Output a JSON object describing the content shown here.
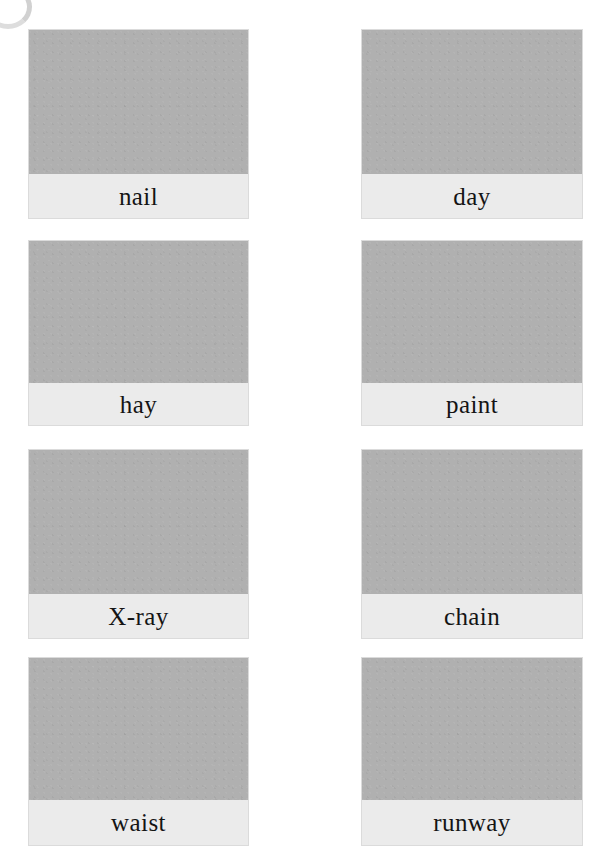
{
  "page": {
    "background_color": "#ffffff",
    "artifact": "scan-edge-arc"
  },
  "styles": {
    "image_placeholder_color": "#b0b0b0",
    "label_band_color": "#e8e8e8",
    "label_text_color": "#141414",
    "card_border_color": "#bebebe"
  },
  "grid": {
    "columns": 2,
    "rows": 4,
    "total_cards": 8
  },
  "cards": [
    {
      "label": "nail",
      "column": "left",
      "row": 1
    },
    {
      "label": "day",
      "column": "right",
      "row": 1
    },
    {
      "label": "hay",
      "column": "left",
      "row": 2
    },
    {
      "label": "paint",
      "column": "right",
      "row": 2
    },
    {
      "label": "X-ray",
      "column": "left",
      "row": 3
    },
    {
      "label": "chain",
      "column": "right",
      "row": 3
    },
    {
      "label": "waist",
      "column": "left",
      "row": 4
    },
    {
      "label": "runway",
      "column": "right",
      "row": 4
    }
  ]
}
